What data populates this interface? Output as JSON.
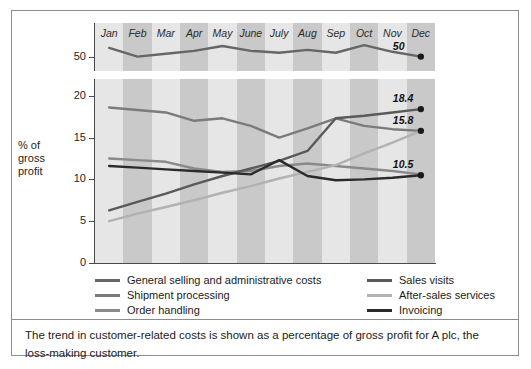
{
  "figure": {
    "caption": "The trend in customer-related costs is shown as a percentage of gross profit for A plc, the loss-making customer."
  },
  "chart_data": {
    "type": "line",
    "title": "",
    "xlabel": "",
    "ylabel": "% of gross profit",
    "categories": [
      "Jan",
      "Feb",
      "Mar",
      "Apr",
      "May",
      "June",
      "July",
      "Aug",
      "Sep",
      "Oct",
      "Nov",
      "Dec"
    ],
    "grid": false,
    "legend_position": "bottom",
    "panels": [
      {
        "name": "top-panel",
        "ylim": [
          48.5,
          53.5
        ],
        "yticks": [
          50
        ],
        "ytick_labels": [
          "50"
        ],
        "series": [
          {
            "name": "General selling and administrative costs",
            "color": "#666666",
            "end_label": "50",
            "values": [
              50.9,
              50.0,
              50.3,
              50.6,
              51.1,
              50.6,
              50.4,
              50.7,
              50.4,
              51.2,
              50.5,
              50.0
            ]
          }
        ]
      },
      {
        "name": "main-panel",
        "ylim": [
          0,
          22
        ],
        "yticks": [
          0,
          5,
          10,
          15,
          20
        ],
        "ytick_labels": [
          "0",
          "5",
          "10",
          "15",
          "20"
        ],
        "series": [
          {
            "name": "Shipment processing",
            "color": "#7b7b7b",
            "end_label": "",
            "values": [
              18.6,
              18.3,
              18.0,
              17.0,
              17.3,
              16.4,
              15.0,
              16.1,
              17.3,
              16.4,
              16.0,
              15.8
            ]
          },
          {
            "name": "Order handling",
            "color": "#8a8a8a",
            "end_label": "",
            "values": [
              12.5,
              12.3,
              12.1,
              11.3,
              10.9,
              11.0,
              11.6,
              11.9,
              11.6,
              11.3,
              11.0,
              10.6
            ]
          },
          {
            "name": "Sales visits",
            "color": "#5a5a5a",
            "end_label": "18.4",
            "values": [
              6.3,
              7.3,
              8.3,
              9.4,
              10.4,
              11.3,
              12.2,
              13.4,
              17.3,
              17.6,
              18.0,
              18.4
            ]
          },
          {
            "name": "After-sales services",
            "color": "#b2b2b2",
            "end_label": "15.8",
            "values": [
              5.0,
              5.9,
              6.7,
              7.5,
              8.4,
              9.2,
              10.1,
              10.9,
              11.7,
              13.1,
              14.4,
              15.8
            ]
          },
          {
            "name": "Invoicing",
            "color": "#2b2b2b",
            "end_label": "10.5",
            "values": [
              11.6,
              11.4,
              11.2,
              11.0,
              10.8,
              10.6,
              12.3,
              10.4,
              9.9,
              10.0,
              10.2,
              10.5
            ]
          }
        ]
      }
    ],
    "legend": [
      {
        "label": "General selling and administrative costs",
        "color": "#666666"
      },
      {
        "label": "Shipment processing",
        "color": "#7b7b7b"
      },
      {
        "label": "Order handling",
        "color": "#8a8a8a"
      },
      {
        "label": "Sales visits",
        "color": "#5a5a5a"
      },
      {
        "label": "After-sales services",
        "color": "#b2b2b2"
      },
      {
        "label": "Invoicing",
        "color": "#2b2b2b"
      }
    ]
  }
}
